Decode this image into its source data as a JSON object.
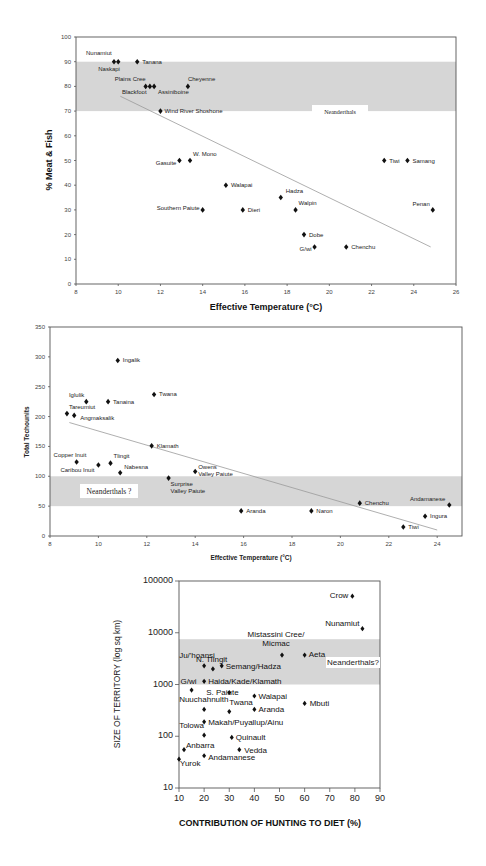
{
  "chart_data": [
    {
      "type": "scatter",
      "title": "",
      "xlabel": "Effective Temperature (°C)",
      "ylabel": "% Meat & Fish",
      "xlim": [
        8,
        26
      ],
      "ylim": [
        0,
        100
      ],
      "xticks": [
        8,
        10,
        12,
        14,
        16,
        18,
        20,
        22,
        24,
        26
      ],
      "yticks": [
        0,
        10,
        20,
        30,
        40,
        50,
        60,
        70,
        80,
        90,
        100
      ],
      "grid": false,
      "band": {
        "label": "Neanderthals",
        "from": 70,
        "to": 90
      },
      "trendline": {
        "x": [
          10.1,
          24.8
        ],
        "y": [
          76,
          15
        ]
      },
      "points": [
        {
          "label": "Nunamiut",
          "x": 9.8,
          "y": 90
        },
        {
          "label": "Naskapi",
          "x": 10.0,
          "y": 90
        },
        {
          "label": "Tanana",
          "x": 10.9,
          "y": 90
        },
        {
          "label": "Plains Cree",
          "x": 11.3,
          "y": 80
        },
        {
          "label": "Blackfoot",
          "x": 11.5,
          "y": 80
        },
        {
          "label": "Assiniboine",
          "x": 11.7,
          "y": 80
        },
        {
          "label": "Cheyenne",
          "x": 13.3,
          "y": 80
        },
        {
          "label": "Wind River Shoshone",
          "x": 12.0,
          "y": 70
        },
        {
          "label": "Gasuite",
          "x": 12.9,
          "y": 50
        },
        {
          "label": "W. Mono",
          "x": 13.4,
          "y": 50
        },
        {
          "label": "Walapai",
          "x": 15.1,
          "y": 40
        },
        {
          "label": "Southern Paiute",
          "x": 14.0,
          "y": 30
        },
        {
          "label": "Dieri",
          "x": 15.9,
          "y": 30
        },
        {
          "label": "Hadza",
          "x": 17.7,
          "y": 35
        },
        {
          "label": "Walpin",
          "x": 18.4,
          "y": 30
        },
        {
          "label": "Dobe",
          "x": 18.8,
          "y": 20
        },
        {
          "label": "G/wi",
          "x": 19.3,
          "y": 15
        },
        {
          "label": "Chenchu",
          "x": 20.8,
          "y": 15
        },
        {
          "label": "Tiwi",
          "x": 22.6,
          "y": 50
        },
        {
          "label": "Samang",
          "x": 23.7,
          "y": 50
        },
        {
          "label": "Penan",
          "x": 24.9,
          "y": 30
        }
      ]
    },
    {
      "type": "scatter",
      "title": "",
      "xlabel": "Effective Temperature (°C)",
      "ylabel": "Total Techounits",
      "xlim": [
        8,
        25
      ],
      "ylim": [
        0,
        350
      ],
      "xticks": [
        8,
        10,
        12,
        14,
        16,
        18,
        20,
        22,
        24
      ],
      "yticks": [
        0,
        50,
        100,
        150,
        200,
        250,
        300,
        350
      ],
      "grid": false,
      "band": {
        "label": "Neanderthals ?",
        "from": 50,
        "to": 100
      },
      "trendline": {
        "x": [
          8.8,
          24.0
        ],
        "y": [
          190,
          10
        ]
      },
      "points": [
        {
          "label": "Ingalik",
          "x": 10.8,
          "y": 294
        },
        {
          "label": "Iglulik",
          "x": 9.5,
          "y": 225
        },
        {
          "label": "Tanaina",
          "x": 10.4,
          "y": 225
        },
        {
          "label": "Tareumiut",
          "x": 8.7,
          "y": 205
        },
        {
          "label": "Angmaksalik",
          "x": 9.0,
          "y": 202
        },
        {
          "label": "Twana",
          "x": 12.3,
          "y": 237
        },
        {
          "label": "Klamath",
          "x": 12.2,
          "y": 151
        },
        {
          "label": "Copper Inuit",
          "x": 9.1,
          "y": 124
        },
        {
          "label": "Caribou Inuit",
          "x": 10.0,
          "y": 119
        },
        {
          "label": "Tlingit",
          "x": 10.5,
          "y": 122
        },
        {
          "label": "Nabesna",
          "x": 10.9,
          "y": 106
        },
        {
          "label": "Surprise Valley Paiute",
          "x": 12.9,
          "y": 97
        },
        {
          "label": "Owens Valley Paiute",
          "x": 14.0,
          "y": 108
        },
        {
          "label": "Aranda",
          "x": 15.9,
          "y": 42
        },
        {
          "label": "Naron",
          "x": 18.8,
          "y": 42
        },
        {
          "label": "Chenchu",
          "x": 20.8,
          "y": 55
        },
        {
          "label": "Andamanese",
          "x": 24.5,
          "y": 52
        },
        {
          "label": "Ingura",
          "x": 23.5,
          "y": 33
        },
        {
          "label": "Tiwi",
          "x": 22.6,
          "y": 15
        }
      ]
    },
    {
      "type": "scatter",
      "title": "",
      "xlabel": "CONTRIBUTION OF HUNTING TO DIET (%)",
      "ylabel": "SIZE OF TERRITORY (log sq km)",
      "xlim": [
        10,
        90
      ],
      "ylim": [
        10,
        100000
      ],
      "yscale": "log",
      "xticks": [
        10,
        20,
        30,
        40,
        50,
        60,
        70,
        80,
        90
      ],
      "yticks": [
        10,
        100,
        1000,
        10000,
        100000
      ],
      "grid": false,
      "band": {
        "label": "Neanderthals?",
        "from": 1000,
        "to": 7500
      },
      "points": [
        {
          "label": "Crow",
          "x": 79,
          "y": 51000
        },
        {
          "label": "Nunamiut",
          "x": 83,
          "y": 12000
        },
        {
          "label": "Mistassini Cree/ Micmac",
          "x": 51,
          "y": 3700
        },
        {
          "label": "Aeta",
          "x": 60,
          "y": 3700
        },
        {
          "label": "Ju/'hoansi",
          "x": 20,
          "y": 2300
        },
        {
          "label": "N. Tlingit",
          "x": 23.5,
          "y": 2000
        },
        {
          "label": "Semang/Hadza",
          "x": 27,
          "y": 2300
        },
        {
          "label": "Haida/Kade/Klamath",
          "x": 20,
          "y": 1150
        },
        {
          "label": "G/wi",
          "x": 15,
          "y": 780
        },
        {
          "label": "S. Paiute",
          "x": 30,
          "y": 700
        },
        {
          "label": "Walapai",
          "x": 40,
          "y": 600
        },
        {
          "label": "Mbuti",
          "x": 60,
          "y": 430
        },
        {
          "label": "Nuuchahnulth",
          "x": 20,
          "y": 330
        },
        {
          "label": "Twana",
          "x": 30,
          "y": 300
        },
        {
          "label": "Aranda",
          "x": 40,
          "y": 330
        },
        {
          "label": "Makah/Puyallup/Ainu",
          "x": 20,
          "y": 190
        },
        {
          "label": "Tolowa",
          "x": 20,
          "y": 105
        },
        {
          "label": "Quinault",
          "x": 31,
          "y": 95
        },
        {
          "label": "Anbarra",
          "x": 12,
          "y": 55
        },
        {
          "label": "Vedda",
          "x": 34,
          "y": 55
        },
        {
          "label": "Andamanese",
          "x": 20,
          "y": 42
        },
        {
          "label": "Yurok",
          "x": 10,
          "y": 36
        }
      ]
    }
  ]
}
